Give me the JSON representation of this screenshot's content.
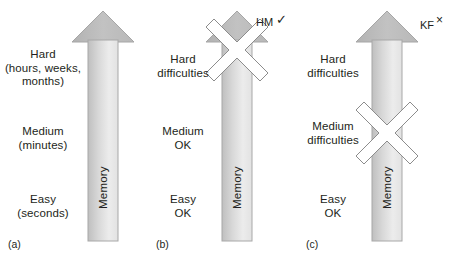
{
  "figure": {
    "colors": {
      "arrow_fill_dark": "#b4b4b4",
      "arrow_fill_light": "#e8e8e8",
      "arrow_stroke": "#9a9a9a",
      "text": "#231f20",
      "cross_fill": "#ffffff",
      "cross_stroke": "#8c8c8c",
      "background": "#ffffff"
    }
  },
  "panels": [
    {
      "tag": "(a)",
      "annotation": "",
      "annotation_mark": "",
      "shaft_label": "Memory",
      "levels": [
        {
          "name": "hard",
          "text": "Hard\n(hours, weeks,\nmonths)"
        },
        {
          "name": "medium",
          "text": "Medium\n(minutes)"
        },
        {
          "name": "easy",
          "text": "Easy\n(seconds)"
        }
      ],
      "cross": "none"
    },
    {
      "tag": "(b)",
      "annotation": "HM",
      "annotation_mark": "✓",
      "shaft_label": "Memory",
      "levels": [
        {
          "name": "hard",
          "text": "Hard\ndifficulties"
        },
        {
          "name": "medium",
          "text": "Medium\nOK"
        },
        {
          "name": "easy",
          "text": "Easy\nOK"
        }
      ],
      "cross": "arrowhead"
    },
    {
      "tag": "(c)",
      "annotation": "KF",
      "annotation_mark": "×",
      "shaft_label": "Memory",
      "levels": [
        {
          "name": "hard",
          "text": "Hard\ndifficulties"
        },
        {
          "name": "medium",
          "text": "Medium\ndifficulties"
        },
        {
          "name": "easy",
          "text": "Easy\nOK"
        }
      ],
      "cross": "shaft-middle"
    }
  ]
}
